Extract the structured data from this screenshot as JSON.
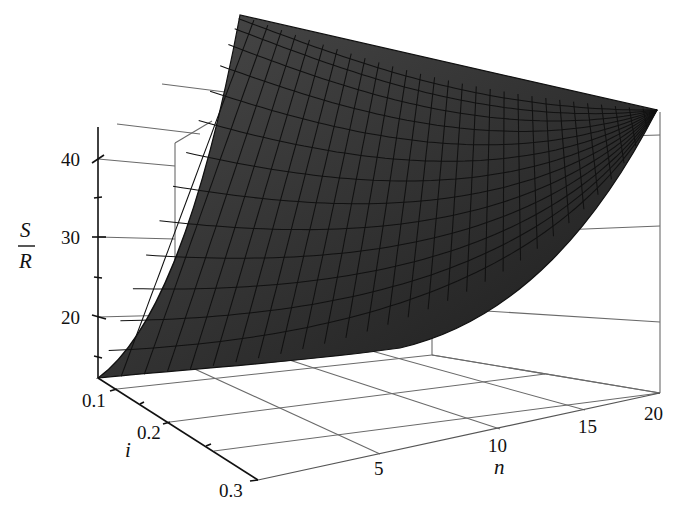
{
  "chart_data": {
    "type": "surface3d",
    "title": "",
    "function": "S/R = ((1+i)^n - 1)/i",
    "xlabel": "n",
    "ylabel": "i",
    "zlabel_numerator": "S",
    "zlabel_denominator": "R",
    "x_ticks": [
      "5",
      "10",
      "15",
      "20"
    ],
    "y_ticks": [
      "0.1",
      "0.2",
      "0.3"
    ],
    "z_ticks": [
      "20",
      "30",
      "40"
    ],
    "x_range": [
      1,
      20
    ],
    "y_range": [
      0.1,
      0.3
    ],
    "z_range": [
      12,
      45
    ],
    "grid": true,
    "surface_color": "#3a3a3a",
    "mesh_color": "#111111",
    "mesh_lines_n": 30,
    "mesh_lines_i": 14,
    "corner_values": [
      {
        "n": 1,
        "i": 0.1,
        "z": 12
      },
      {
        "n": 20,
        "i": 0.1,
        "z": 45
      },
      {
        "n": 1,
        "i": 0.3,
        "z": 12
      },
      {
        "n": 20,
        "i": 0.3,
        "z": 45
      }
    ]
  },
  "labels": {
    "z_num": "S",
    "z_den": "R",
    "i_axis": "i",
    "n_axis": "n",
    "z40": "40",
    "z30": "30",
    "z20": "20",
    "i01": "0.1",
    "i02": "0.2",
    "i03": "0.3",
    "n5": "5",
    "n10": "10",
    "n15": "15",
    "n20": "20"
  }
}
